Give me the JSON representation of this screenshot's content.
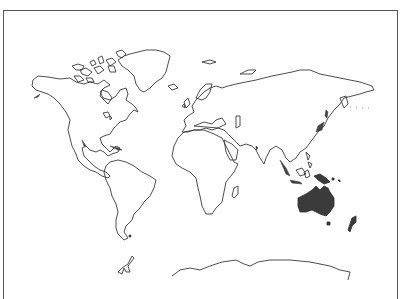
{
  "map": {
    "type": "world-outline",
    "projection": "equirectangular",
    "highlighted_region": "Oceania",
    "highlighted_features": [
      "Australia",
      "New Guinea",
      "New Zealand",
      "Tasmania"
    ],
    "highlight_color": "#3b3b3b",
    "outline_color": "#3a3a3a",
    "background_color": "#ffffff",
    "frame_color": "#555555"
  }
}
